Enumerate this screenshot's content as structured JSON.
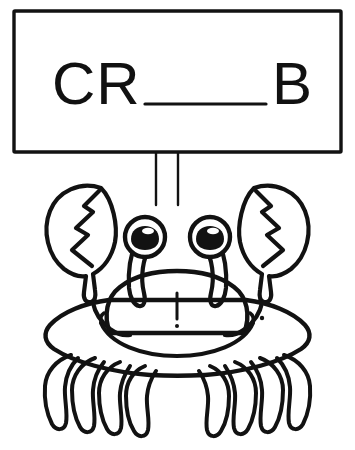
{
  "worksheet": {
    "kind": "spelling-fill-in-the-blank-line-art",
    "background_color": "#ffffff",
    "ink_color": "#121212",
    "title": "CR___B",
    "sign": {
      "prompt_text": "CR___B",
      "prefix_letters": "CR",
      "blank_label": "___",
      "suffix_letters": "B",
      "answer_hint": "CRAB",
      "border_color": "#121212",
      "fill_color": "#ffffff"
    },
    "post": {
      "label": "sign-post",
      "line_count": 2
    },
    "crab": {
      "label": "crab",
      "outline_color": "#121212",
      "body_fill": "#ffffff",
      "claw_count": 2,
      "claw_style": "open-pincer-with-zigzag-split",
      "eye_count": 2,
      "eye_pupil_color": "#121212",
      "legs_per_side": 4,
      "total_legs": 8,
      "mouth": "smile",
      "nose": "vertical-line-with-dot"
    }
  }
}
